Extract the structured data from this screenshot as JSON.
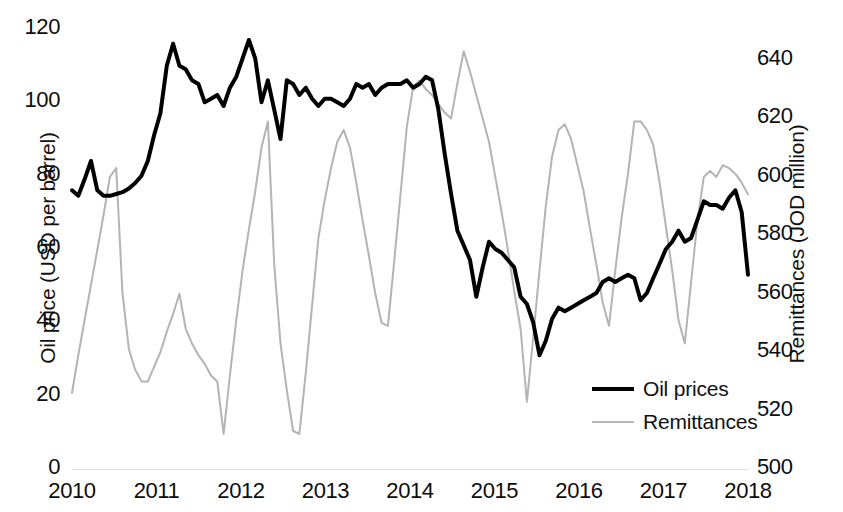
{
  "chart_data": {
    "type": "line",
    "title": "",
    "xlabel": "",
    "grid": false,
    "legend_position": "inside-bottom-right",
    "x_tick_labels": [
      "2010",
      "2011",
      "2012",
      "2013",
      "2014",
      "2015",
      "2016",
      "2017",
      "2018"
    ],
    "axes": {
      "left": {
        "label": "Oil price (USD per barrel)",
        "ticks": [
          "0",
          "20",
          "40",
          "60",
          "80",
          "100",
          "120"
        ],
        "tick_values": [
          0,
          20,
          40,
          60,
          80,
          100,
          120
        ],
        "min": 0,
        "max": 120
      },
      "right": {
        "label": "Remittances (JOD million)",
        "ticks": [
          "500",
          "520",
          "540",
          "560",
          "580",
          "600",
          "620",
          "640"
        ],
        "tick_values": [
          500,
          520,
          540,
          560,
          580,
          600,
          620,
          640
        ],
        "min": 500,
        "max": 645
      }
    },
    "series": [
      {
        "name": "Oil prices",
        "axis": "left",
        "color": "#000000",
        "width": 4,
        "values": [
          76,
          74.5,
          79,
          84,
          76,
          74.5,
          74.5,
          75,
          75.5,
          76.5,
          78,
          80,
          84,
          91,
          97,
          110,
          116,
          110,
          109,
          106,
          105,
          100,
          101,
          102,
          99,
          104,
          107,
          112,
          117,
          112,
          100,
          106,
          98,
          90,
          106,
          105,
          102,
          104,
          101,
          99,
          101,
          101,
          100,
          99,
          101,
          105,
          104,
          105,
          102,
          104,
          105,
          105,
          105,
          106,
          104,
          105,
          107,
          106,
          98,
          86,
          75,
          65,
          61,
          57,
          47,
          55,
          62,
          60,
          59,
          57,
          55,
          47,
          45,
          40,
          31,
          35,
          41,
          44,
          43,
          44,
          45,
          46,
          47,
          48,
          51,
          52,
          51,
          52,
          53,
          52,
          46,
          48,
          52,
          56,
          60,
          62,
          65,
          62,
          63,
          68,
          73,
          72,
          72,
          71,
          74,
          76,
          70,
          53
        ]
      },
      {
        "name": "Remittances",
        "axis": "right",
        "color": "#b4b4b4",
        "width": 2,
        "values": [
          526,
          539,
          551,
          563,
          575,
          587,
          600,
          603,
          560,
          541,
          534,
          530,
          530,
          535,
          540,
          547,
          553,
          560,
          548,
          543,
          539,
          536,
          532,
          530,
          512,
          532,
          551,
          568,
          582,
          595,
          610,
          619,
          570,
          543,
          527,
          513,
          512,
          533,
          556,
          579,
          592,
          603,
          612,
          616,
          610,
          598,
          585,
          573,
          560,
          550,
          549,
          571,
          594,
          617,
          631,
          633,
          630,
          628,
          625,
          622,
          620,
          632,
          643,
          636,
          628,
          620,
          612,
          600,
          588,
          575,
          561,
          548,
          523,
          545,
          568,
          590,
          607,
          616,
          618,
          613,
          604,
          595,
          582,
          570,
          557,
          549,
          568,
          586,
          601,
          619,
          619,
          616,
          611,
          598,
          583,
          568,
          551,
          543,
          564,
          585,
          600,
          602,
          600,
          604,
          603,
          601,
          598,
          594
        ]
      }
    ]
  },
  "legend": {
    "entries": [
      {
        "label": "Oil prices"
      },
      {
        "label": "Remittances"
      }
    ]
  }
}
